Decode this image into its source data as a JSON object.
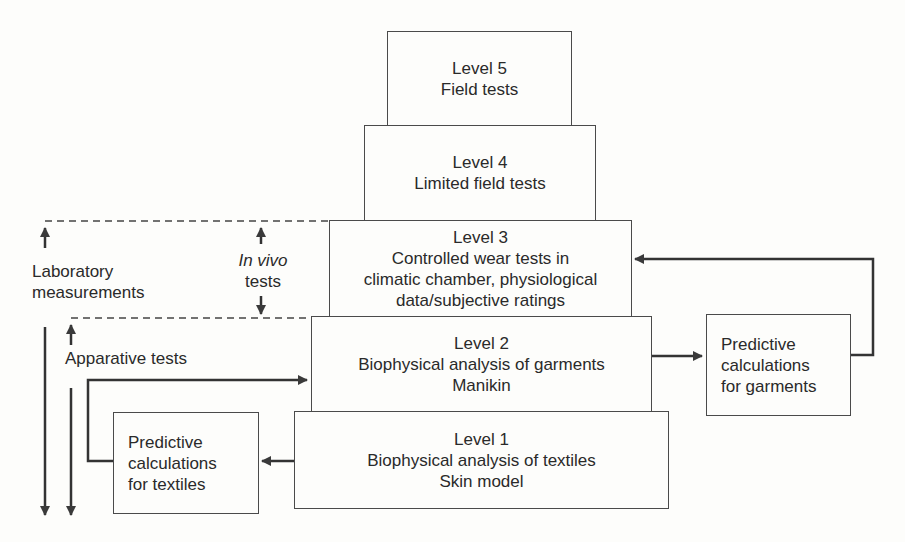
{
  "levels": [
    {
      "title": "Level 5",
      "lines": [
        "Field tests"
      ]
    },
    {
      "title": "Level 4",
      "lines": [
        "Limited field tests"
      ]
    },
    {
      "title": "Level 3",
      "lines": [
        "Controlled wear tests in",
        "climatic chamber, physiological",
        "data/subjective ratings"
      ]
    },
    {
      "title": "Level 2",
      "lines": [
        "Biophysical analysis of garments",
        "Manikin"
      ]
    },
    {
      "title": "Level 1",
      "lines": [
        "Biophysical analysis of textiles",
        "Skin model"
      ]
    }
  ],
  "side_boxes": {
    "garments": [
      "Predictive",
      "calculations",
      "for garments"
    ],
    "textiles": [
      "Predictive",
      "calculations",
      "for textiles"
    ]
  },
  "labels": {
    "laboratory": [
      "Laboratory",
      "measurements"
    ],
    "in_vivo": {
      "italic": "In vivo",
      "text": "tests"
    },
    "apparative": "Apparative tests"
  },
  "colors": {
    "line": "#3a3a3a",
    "background": "#fdfdfb"
  }
}
